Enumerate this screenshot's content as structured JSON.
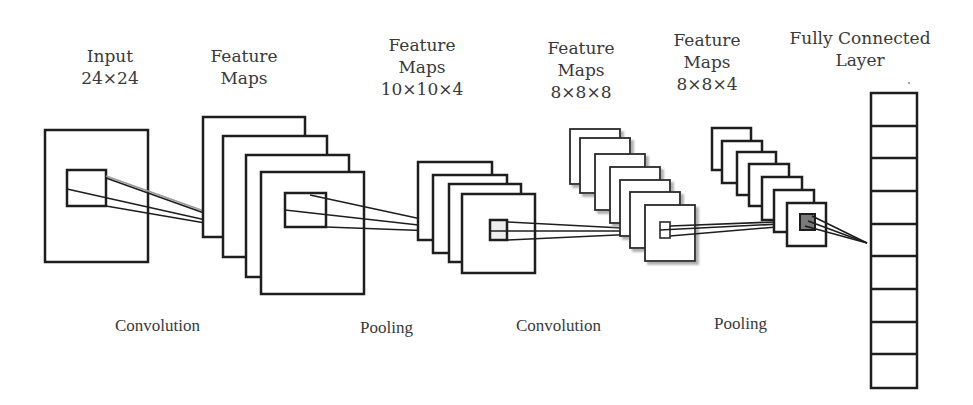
{
  "diagram": {
    "type": "cnn-architecture",
    "layer_labels": [
      {
        "id": "input",
        "line1": "Input",
        "line2": "24×24",
        "line3": ""
      },
      {
        "id": "feature-maps-1",
        "line1": "Feature",
        "line2": "Maps",
        "line3": ""
      },
      {
        "id": "feature-maps-2",
        "line1": "Feature",
        "line2": "Maps",
        "line3": "10×10×4"
      },
      {
        "id": "feature-maps-3",
        "line1": "Feature",
        "line2": "Maps",
        "line3": "8×8×8"
      },
      {
        "id": "feature-maps-4",
        "line1": "Feature",
        "line2": "Maps",
        "line3": "8×8×4"
      },
      {
        "id": "fully-connected",
        "line1": "Fully Connected",
        "line2": "Layer",
        "line3": ""
      }
    ],
    "operations": [
      {
        "id": "convolution-1",
        "label": "Convolution"
      },
      {
        "id": "pooling-1",
        "label": "Pooling"
      },
      {
        "id": "convolution-2",
        "label": "Convolution"
      },
      {
        "id": "pooling-2",
        "label": "Pooling"
      }
    ],
    "stacks": {
      "input_maps": 1,
      "conv1_maps": 4,
      "pool1_maps": 4,
      "conv2_maps": 7,
      "pool2_maps": 7,
      "fc_units": 9
    },
    "colors": {
      "stroke": "#1e1e1e",
      "fill": "#ffffff",
      "shadow": "#b8b8b8",
      "highlight_patch": "#7a7a7a",
      "text": "#3a3a3a"
    }
  }
}
